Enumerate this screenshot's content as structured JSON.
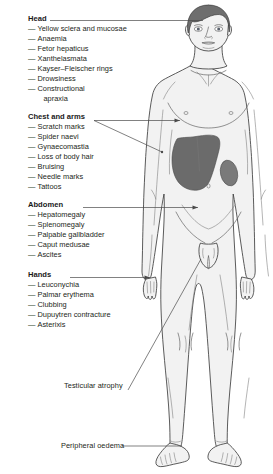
{
  "diagram": {
    "figure_name": "male-patient-anterior-view",
    "colors": {
      "body_fill": "#f2f2f2",
      "outline": "#3f3f3f",
      "hair": "#6e6e6e",
      "liver": "#6b6b6b",
      "spleen": "#7a7a7a",
      "leader_line": "#4a4a4a",
      "text": "#231f20"
    },
    "groups": [
      {
        "id": "head",
        "heading": "Head",
        "items": [
          "Yellow sclera and mucosae",
          "Anaemia",
          "Fetor hepaticus",
          "Xanthelasmata",
          "Kayser–Fleischer rings",
          "Drowsiness",
          "Constructional",
          "apraxia"
        ]
      },
      {
        "id": "chest-and-arms",
        "heading": "Chest and arms",
        "items": [
          "Scratch marks",
          "Spider naevi",
          "Gynaecomastia",
          "Loss of body hair",
          "Bruising",
          "Needle marks",
          "Tattoos"
        ]
      },
      {
        "id": "abdomen",
        "heading": "Abdomen",
        "items": [
          "Hepatomegaly",
          "Splenomegaly",
          "Palpable gallbladder",
          "Caput medusae",
          "Ascites"
        ]
      },
      {
        "id": "hands",
        "heading": "Hands",
        "items": [
          "Leuconychia",
          "Palmar erythema",
          "Clubbing",
          "Dupuytren contracture",
          "Asterixis"
        ]
      }
    ],
    "callouts": [
      {
        "id": "testicular-atrophy",
        "label": "Testicular atrophy"
      },
      {
        "id": "peripheral-oedema",
        "label": "Peripheral oedema"
      }
    ],
    "dash": "—"
  }
}
